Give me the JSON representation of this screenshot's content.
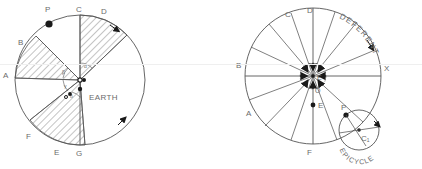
{
  "figure": {
    "background_color": "#ffffff",
    "line_color": "#555555",
    "text_color": "#6b6b6b",
    "marker_color": "#1a1a1a"
  },
  "left_diagram": {
    "name": "equant-eccentric-circle",
    "center_label": "EARTH",
    "point_labels": {
      "p": "P",
      "c": "C",
      "d": "D",
      "b": "B",
      "a": "A",
      "f": "F",
      "e": "E",
      "g": "G"
    },
    "angle_labels": {
      "alpha": "α",
      "beta": "β",
      "gamma": "γ",
      "delta": "δ"
    },
    "hatched_sectors": [
      "C-D",
      "A-B",
      "E-F"
    ],
    "motion_arrows": 2
  },
  "right_diagram": {
    "name": "deferent-and-epicycle",
    "deferent_label": "DEFERENT",
    "epicycle_label": "EPICYCLE",
    "point_labels": {
      "c": "C",
      "d": "D",
      "b": "B",
      "x": "X",
      "a": "A",
      "f": "F",
      "o": "O",
      "e_center": "E",
      "e_lower": "E",
      "p": "P",
      "c1": "C₁"
    },
    "radii_count": 12,
    "motion_arrows": 2
  }
}
